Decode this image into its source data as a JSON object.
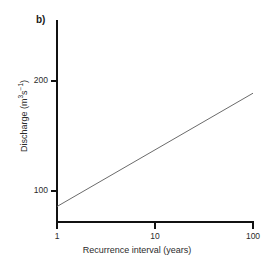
{
  "panel": {
    "label": "b)"
  },
  "chart_data": {
    "type": "line",
    "title": "",
    "subtitle": "",
    "xlabel": "Recurrence interval (years)",
    "ylabel": "Discharge (m³s⁻¹)",
    "ylabel_base": "Discharge (m",
    "ylabel_sup1": "3",
    "ylabel_mid": "s",
    "ylabel_sup2": "−1",
    "ylabel_end": ")",
    "xscale": "log",
    "yscale": "linear",
    "xlim": [
      1,
      100
    ],
    "ylim": [
      60,
      240
    ],
    "grid": false,
    "legend": false,
    "xticks": [
      1,
      10,
      100
    ],
    "xticklabels": [
      "1",
      "10",
      "100"
    ],
    "yticks": [
      100,
      200
    ],
    "yticklabels": [
      "100",
      "200"
    ],
    "series": [
      {
        "name": "flood frequency curve",
        "color": "#6b6b6b",
        "linewidth": 1,
        "x": [
          1,
          10,
          100
        ],
        "y": [
          85,
          136,
          188
        ]
      }
    ],
    "annotations": []
  },
  "style": {
    "axis_color": "#111111",
    "line_color": "#6b6b6b",
    "text_color": "#2b2b2b",
    "background": "#ffffff"
  }
}
